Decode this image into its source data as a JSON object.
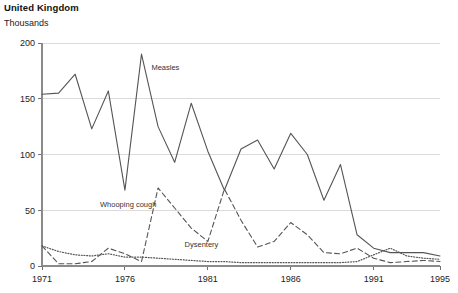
{
  "header": {
    "title": "United Kingdom",
    "units": "Thousands"
  },
  "chart_data": {
    "type": "line",
    "title": "United Kingdom",
    "subtitle": "Thousands",
    "xlabel": "",
    "ylabel": "Thousands",
    "xlim": [
      1971,
      1995
    ],
    "ylim": [
      0,
      200
    ],
    "yticks": [
      0,
      50,
      100,
      150,
      200
    ],
    "ytick_labels": [
      "0",
      "50",
      "100",
      "150",
      "200"
    ],
    "xticks": [
      1971,
      1976,
      1981,
      1986,
      1991,
      1995
    ],
    "xtick_labels": [
      "1971",
      "1976",
      "1981",
      "1986",
      "1991",
      "1995"
    ],
    "grid": true,
    "legend_position": "inline-annotations",
    "x": [
      1971,
      1972,
      1973,
      1974,
      1975,
      1976,
      1977,
      1978,
      1979,
      1980,
      1981,
      1982,
      1983,
      1984,
      1985,
      1986,
      1987,
      1988,
      1989,
      1990,
      1991,
      1992,
      1993,
      1994,
      1995
    ],
    "series": [
      {
        "name": "Measles",
        "style": "solid",
        "color": "#555555",
        "label": "Measles",
        "values": [
          154,
          155,
          172,
          123,
          157,
          68,
          190,
          125,
          93,
          146,
          103,
          68,
          105,
          113,
          87,
          119,
          100,
          59,
          91,
          28,
          16,
          12,
          12,
          12,
          9
        ]
      },
      {
        "name": "Whooping cough",
        "style": "dashed",
        "color": "#555555",
        "label": "Whooping cough",
        "values": [
          18,
          2,
          2,
          4,
          16,
          11,
          4,
          70,
          52,
          34,
          22,
          69,
          41,
          17,
          22,
          39,
          28,
          12,
          11,
          16,
          7,
          3,
          4,
          5,
          4
        ]
      },
      {
        "name": "Dysentery",
        "style": "dotted",
        "color": "#555555",
        "label": "Dysentery",
        "values": [
          18,
          13,
          10,
          9,
          11,
          8,
          8,
          7,
          6,
          5,
          4,
          4,
          3,
          3,
          3,
          3,
          3,
          3,
          3,
          4,
          10,
          16,
          9,
          7,
          6
        ]
      }
    ],
    "annotations": [
      {
        "text": "Measles",
        "x": 1977.6,
        "y": 176
      },
      {
        "text": "Whooping cough",
        "x": 1974.5,
        "y": 53
      },
      {
        "text": "Dysentery",
        "x": 1979.6,
        "y": 17
      }
    ]
  }
}
